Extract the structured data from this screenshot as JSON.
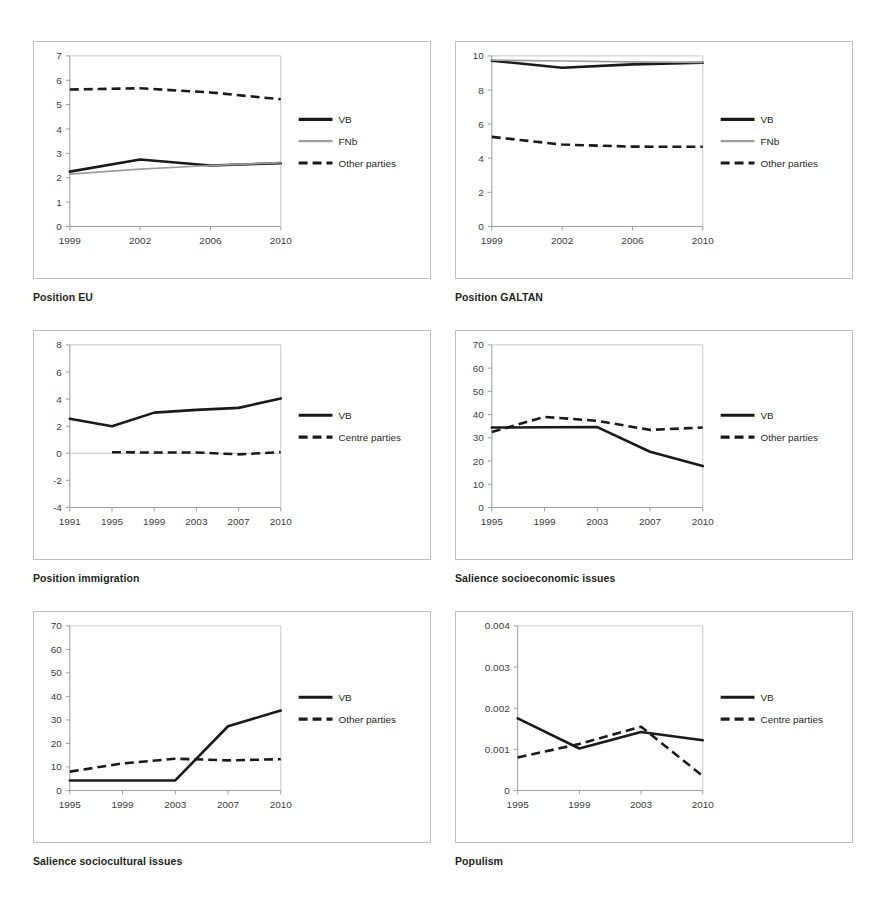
{
  "figure": {
    "background": "#ffffff",
    "colors": {
      "vb_line": "#1a1a1a",
      "fnb_line": "#9d9d9d",
      "other_line": "#1a1a1a",
      "axis": "#9a9a9a",
      "text": "#231f20"
    }
  },
  "captions": {
    "c1": "Position EU",
    "c2": "Position GALTAN",
    "c3": "Position immigration",
    "c4": "Salience socioeconomic issues",
    "c5": "Salience sociocultural issues",
    "c6": "Populism"
  },
  "legend_labels": {
    "vb": "VB",
    "fnb": "FNb",
    "other": "Other parties",
    "centre": "Centre parties"
  },
  "chart_data": [
    {
      "id": "position-eu",
      "type": "line",
      "title": "Position EU",
      "xlabel": "",
      "ylabel": "",
      "grid": false,
      "legend_position": "right",
      "x": [
        "1999",
        "2002",
        "2006",
        "2010"
      ],
      "xticklabels": [
        "1999",
        "2002",
        "2006",
        "2010"
      ],
      "yticklabels": [
        "0",
        "1",
        "2",
        "3",
        "4",
        "5",
        "6",
        "7"
      ],
      "ylim": [
        0,
        7
      ],
      "series": [
        {
          "name": "VB",
          "style": "solid-black",
          "values": [
            2.25,
            2.75,
            2.5,
            2.6
          ]
        },
        {
          "name": "FNb",
          "style": "solid-gray",
          "values": [
            2.15,
            2.35,
            2.5,
            2.62
          ]
        },
        {
          "name": "Other parties",
          "style": "dashed-black",
          "values": [
            5.62,
            5.67,
            5.5,
            5.22
          ]
        }
      ]
    },
    {
      "id": "position-galtan",
      "type": "line",
      "title": "Position GALTAN",
      "xlabel": "",
      "ylabel": "",
      "grid": false,
      "legend_position": "right",
      "x": [
        "1999",
        "2002",
        "2006",
        "2010"
      ],
      "xticklabels": [
        "1999",
        "2002",
        "2006",
        "2010"
      ],
      "yticklabels": [
        "0",
        "2",
        "4",
        "6",
        "8",
        "10"
      ],
      "ylim": [
        0,
        10
      ],
      "series": [
        {
          "name": "VB",
          "style": "solid-black",
          "values": [
            9.72,
            9.3,
            9.5,
            9.6
          ]
        },
        {
          "name": "FNb",
          "style": "solid-gray",
          "values": [
            9.75,
            9.7,
            9.65,
            9.62
          ]
        },
        {
          "name": "Other parties",
          "style": "dashed-black",
          "values": [
            5.25,
            4.8,
            4.68,
            4.67
          ]
        }
      ]
    },
    {
      "id": "position-immigration",
      "type": "line",
      "title": "Position immigration",
      "xlabel": "",
      "ylabel": "",
      "grid": false,
      "legend_position": "right",
      "x": [
        "1991",
        "1995",
        "1999",
        "2003",
        "2007",
        "2010"
      ],
      "xticklabels": [
        "1991",
        "1995",
        "1999",
        "2003",
        "2007",
        "2010"
      ],
      "yticklabels": [
        "-4",
        "-2",
        "0",
        "2",
        "4",
        "6",
        "8"
      ],
      "ylim": [
        -4,
        8
      ],
      "series": [
        {
          "name": "VB",
          "style": "solid-black",
          "values": [
            2.55,
            2.0,
            3.0,
            3.2,
            3.35,
            4.05
          ]
        },
        {
          "name": "Centre parties",
          "style": "dashed-black",
          "values": [
            null,
            0.08,
            0.05,
            0.06,
            -0.08,
            0.08
          ]
        }
      ]
    },
    {
      "id": "salience-socioeconomic",
      "type": "line",
      "title": "Salience socioeconomic issues",
      "xlabel": "",
      "ylabel": "",
      "grid": false,
      "legend_position": "right",
      "x": [
        "1995",
        "1999",
        "2003",
        "2007",
        "2010"
      ],
      "xticklabels": [
        "1995",
        "1999",
        "2003",
        "2007",
        "2010"
      ],
      "yticklabels": [
        "0",
        "10",
        "20",
        "30",
        "40",
        "50",
        "60",
        "70"
      ],
      "ylim": [
        0,
        70
      ],
      "series": [
        {
          "name": "VB",
          "style": "solid-black",
          "values": [
            34.4,
            34.5,
            34.6,
            24.0,
            17.8
          ]
        },
        {
          "name": "Other parties",
          "style": "dashed-black",
          "values": [
            32.5,
            39.0,
            37.3,
            33.4,
            34.4
          ]
        }
      ]
    },
    {
      "id": "salience-sociocultural",
      "type": "line",
      "title": "Salience sociocultural issues",
      "xlabel": "",
      "ylabel": "",
      "grid": false,
      "legend_position": "right",
      "x": [
        "1995",
        "1999",
        "2003",
        "2007",
        "2010"
      ],
      "xticklabels": [
        "1995",
        "1999",
        "2003",
        "2007",
        "2010"
      ],
      "yticklabels": [
        "0",
        "10",
        "20",
        "30",
        "40",
        "50",
        "60",
        "70"
      ],
      "ylim": [
        0,
        70
      ],
      "series": [
        {
          "name": "VB",
          "style": "solid-black",
          "values": [
            4.2,
            4.2,
            4.3,
            27.3,
            34.0
          ]
        },
        {
          "name": "Other parties",
          "style": "dashed-black",
          "values": [
            8.0,
            11.5,
            13.5,
            12.8,
            13.3
          ]
        }
      ]
    },
    {
      "id": "populism",
      "type": "line",
      "title": "Populism",
      "xlabel": "",
      "ylabel": "",
      "grid": false,
      "legend_position": "right",
      "x": [
        "1995",
        "1999",
        "2003",
        "2010"
      ],
      "xticklabels": [
        "1995",
        "1999",
        "2003",
        "2010"
      ],
      "yticklabels": [
        "0",
        "0.001",
        "0.002",
        "0.003",
        "0.004"
      ],
      "ylim": [
        0,
        0.004
      ],
      "series": [
        {
          "name": "VB",
          "style": "solid-black",
          "values": [
            0.00175,
            0.00102,
            0.00142,
            0.00122
          ]
        },
        {
          "name": "Centre parties",
          "style": "dashed-black",
          "values": [
            0.0008,
            0.00113,
            0.00155,
            0.00035
          ]
        }
      ]
    }
  ]
}
